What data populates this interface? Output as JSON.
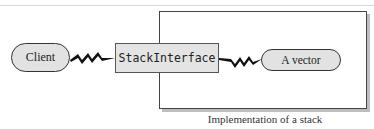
{
  "diagram": {
    "client_label": "Client",
    "interface_label": "StackInterface",
    "implementation_label": "A vector",
    "caption": "Implementation of a stack"
  },
  "colors": {
    "node_fill": "#e2e2e2",
    "stroke": "#333333",
    "shadow": "#bdbdbd"
  }
}
